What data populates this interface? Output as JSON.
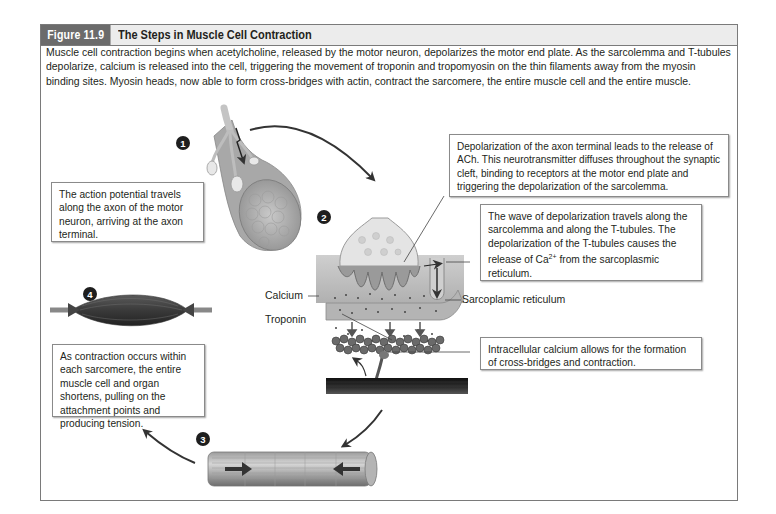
{
  "figure": {
    "label": "Figure 11.9",
    "title": "The Steps in Muscle Cell Contraction",
    "intro": "Muscle cell contraction begins when acetylcholine, released by the motor neuron, depolarizes the motor end plate. As the sarcolemma and T-tubules depolarize, calcium is released into the cell, triggering the movement of troponin and tropomyosin on the thin filaments away from the myosin binding sites. Myosin heads, now able to form cross-bridges with actin, contract the sarcomere, the entire muscle cell and the entire muscle.",
    "colors": {
      "frame_border": "#7a7a7a",
      "label_bg": "#6b6b6b",
      "header_bg": "#ececec",
      "step_badge": "#1e1e1e"
    }
  },
  "steps": [
    {
      "number": "1",
      "text": "The action potential travels along the axon of the motor neuron, arriving at the axon terminal."
    },
    {
      "number": "2",
      "text": "Depolarization of the axon terminal leads to the release of ACh. This neurotransmitter diffuses throughout the synaptic cleft, binding to receptors at the motor end plate and triggering the depolarization of the sarcolemma."
    },
    {
      "number": "3",
      "text": ""
    },
    {
      "number": "4",
      "text": "As contraction occurs within each sarcomere, the entire muscle cell and organ shortens, pulling on the attachment points and producing tension."
    }
  ],
  "callouts": {
    "t_tubules_pre": "The wave of depolarization travels along the sarcolemma and along the T-tubules. The depolarization of the T-tubules causes the release of Ca",
    "t_tubules_sup": "2+",
    "t_tubules_post": " from the sarcoplasmic reticulum.",
    "cross_bridges": "Intracellular calcium allows for the formation of cross-bridges and contraction."
  },
  "labels": {
    "calcium": "Calcium",
    "troponin": "Troponin",
    "sarcoplasmic_reticulum": "Sarcoplamic reticulum"
  }
}
